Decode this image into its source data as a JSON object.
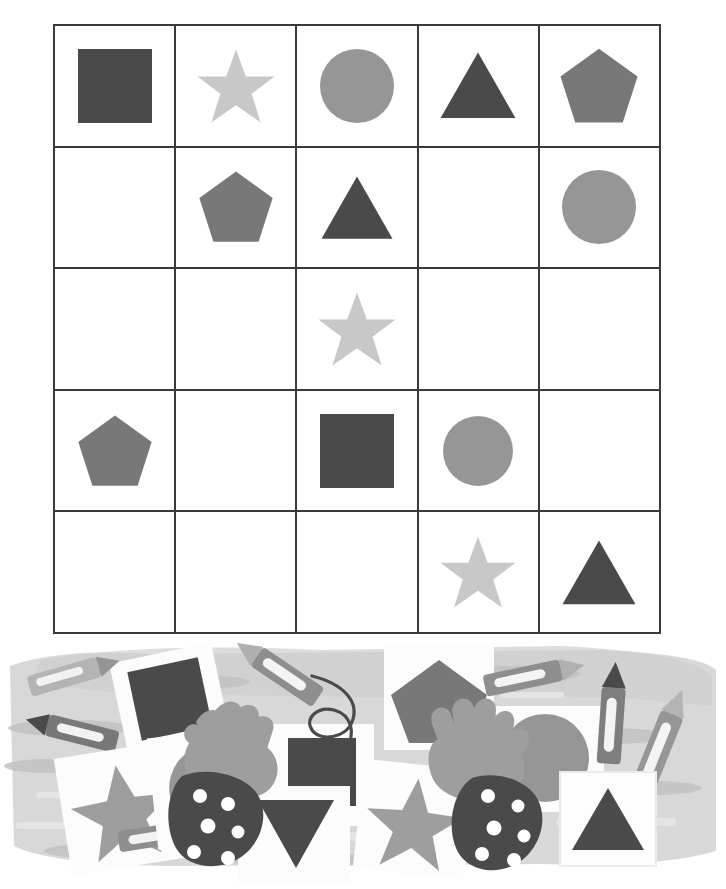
{
  "page": {
    "background_color": "#ffffff",
    "width": 726,
    "height": 889
  },
  "palette": {
    "ink": "#3a3a3a",
    "shape_dark": "#4a4a4a",
    "shape_mid_dark": "#787878",
    "shape_mid": "#969696",
    "shape_light": "#c8c8c8",
    "paper_white": "#ffffff",
    "scene_bg": "#d6d6d6",
    "scene_shadow": "#c2c2c2",
    "scene_pale": "#e4e4e4",
    "card_white": "#fcfcfc",
    "skin": "#9e9e9e",
    "sleeve": "#4a4a4a",
    "dot": "#ffffff"
  },
  "grid": {
    "rows": 5,
    "cols": 5,
    "line_color": "#3a3a3a",
    "cell_background": "#ffffff",
    "cells": [
      [
        {
          "shape": "square",
          "color": "#4a4a4a",
          "size": 74,
          "label": "dark square"
        },
        {
          "shape": "star",
          "color": "#c8c8c8",
          "size": 82,
          "label": "light star"
        },
        {
          "shape": "circle",
          "color": "#969696",
          "size": 74,
          "label": "medium circle"
        },
        {
          "shape": "triangle",
          "color": "#4a4a4a",
          "size": 78,
          "label": "dark triangle"
        },
        {
          "shape": "pentagon",
          "color": "#787878",
          "size": 82,
          "label": "gray pentagon"
        }
      ],
      [
        {
          "shape": "none",
          "color": "",
          "size": 0,
          "label": "empty"
        },
        {
          "shape": "pentagon",
          "color": "#787878",
          "size": 78,
          "label": "gray pentagon"
        },
        {
          "shape": "triangle",
          "color": "#4a4a4a",
          "size": 74,
          "label": "dark triangle"
        },
        {
          "shape": "none",
          "color": "",
          "size": 0,
          "label": "empty"
        },
        {
          "shape": "circle",
          "color": "#969696",
          "size": 74,
          "label": "medium circle"
        }
      ],
      [
        {
          "shape": "none",
          "color": "",
          "size": 0,
          "label": "empty"
        },
        {
          "shape": "none",
          "color": "",
          "size": 0,
          "label": "empty"
        },
        {
          "shape": "star",
          "color": "#c8c8c8",
          "size": 82,
          "label": "light star"
        },
        {
          "shape": "none",
          "color": "",
          "size": 0,
          "label": "empty"
        },
        {
          "shape": "none",
          "color": "",
          "size": 0,
          "label": "empty"
        }
      ],
      [
        {
          "shape": "pentagon",
          "color": "#787878",
          "size": 78,
          "label": "gray pentagon"
        },
        {
          "shape": "none",
          "color": "",
          "size": 0,
          "label": "empty"
        },
        {
          "shape": "square",
          "color": "#4a4a4a",
          "size": 74,
          "label": "dark square"
        },
        {
          "shape": "circle",
          "color": "#969696",
          "size": 70,
          "label": "medium circle"
        },
        {
          "shape": "none",
          "color": "",
          "size": 0,
          "label": "empty"
        }
      ],
      [
        {
          "shape": "none",
          "color": "",
          "size": 0,
          "label": "empty"
        },
        {
          "shape": "none",
          "color": "",
          "size": 0,
          "label": "empty"
        },
        {
          "shape": "none",
          "color": "",
          "size": 0,
          "label": "empty"
        },
        {
          "shape": "star",
          "color": "#c8c8c8",
          "size": 80,
          "label": "light star"
        },
        {
          "shape": "triangle",
          "color": "#4a4a4a",
          "size": 76,
          "label": "dark triangle"
        }
      ]
    ]
  },
  "illustration": {
    "description": "Children's hands with polka-dot sleeves reaching over scattered crayons and shape flashcards",
    "items": [
      {
        "name": "crayon",
        "count": 6,
        "color": "#969696"
      },
      {
        "name": "card-square",
        "count": 2,
        "shape": "square",
        "color": "#4a4a4a"
      },
      {
        "name": "card-star",
        "count": 2,
        "shape": "star",
        "color": "#969696"
      },
      {
        "name": "card-circle",
        "count": 2,
        "shape": "circle",
        "color": "#969696"
      },
      {
        "name": "card-pentagon",
        "count": 1,
        "shape": "pentagon",
        "color": "#787878"
      },
      {
        "name": "card-triangle-down",
        "count": 1,
        "shape": "triangle-down",
        "color": "#4a4a4a"
      },
      {
        "name": "card-triangle-up",
        "count": 1,
        "shape": "triangle-up",
        "color": "#4a4a4a"
      },
      {
        "name": "hand",
        "count": 2,
        "color": "#9e9e9e"
      },
      {
        "name": "sleeve-polka-dot",
        "count": 2,
        "color": "#4a4a4a"
      },
      {
        "name": "squiggle-scribble",
        "count": 1,
        "color": "#4a4a4a"
      }
    ]
  }
}
